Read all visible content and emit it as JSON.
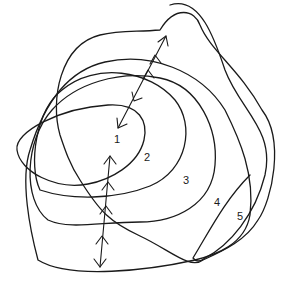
{
  "diagram": {
    "type": "nested-overlapping-closed-loops",
    "stroke_color": "#1a1a1a",
    "background": "#ffffff",
    "regions": [
      {
        "label": "1",
        "x": 114,
        "y": 139
      },
      {
        "label": "2",
        "x": 146,
        "y": 157
      },
      {
        "label": "3",
        "x": 184,
        "y": 180
      },
      {
        "label": "4",
        "x": 215,
        "y": 202
      },
      {
        "label": "5",
        "x": 237,
        "y": 216
      }
    ],
    "arrows": [
      {
        "name": "upper-transition-arrow",
        "from": [
          118,
          128
        ],
        "to": [
          166,
          36
        ]
      },
      {
        "name": "lower-transition-arrow",
        "from": [
          100,
          267
        ],
        "to": [
          110,
          156
        ]
      }
    ]
  }
}
